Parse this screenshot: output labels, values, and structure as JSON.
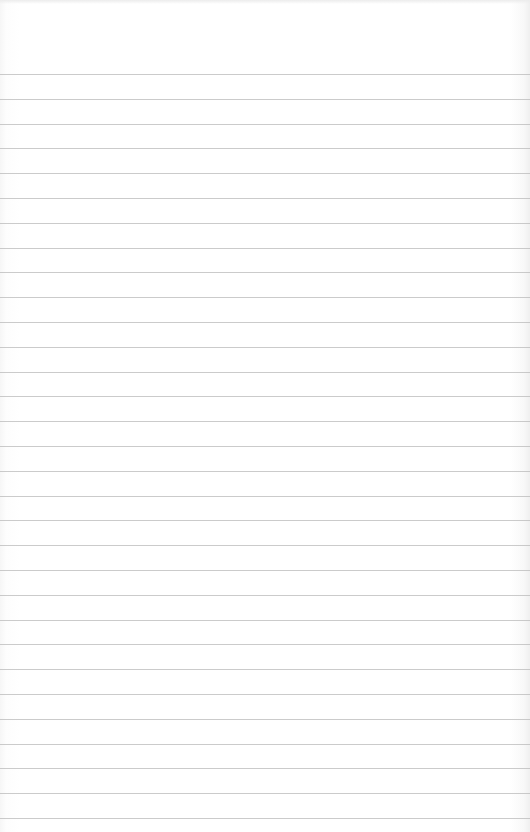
{
  "page": {
    "type": "lined-paper",
    "background_color": "#ffffff",
    "rule_color": "#b9b9b9",
    "first_rule_y": 74,
    "rule_spacing": 24.8,
    "rule_count": 31
  },
  "content": {
    "text": ""
  }
}
